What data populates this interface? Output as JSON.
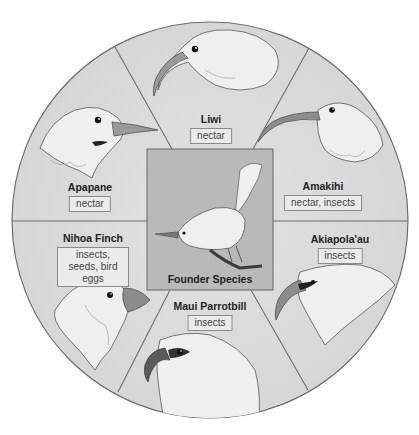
{
  "diagram": {
    "center": {
      "label": "Founder Species"
    },
    "species": [
      {
        "name": "Liwi",
        "diet": "nectar",
        "beak": "long curved"
      },
      {
        "name": "Amakihi",
        "diet": "nectar, insects",
        "beak": "long curved thin"
      },
      {
        "name": "Akiapola'au",
        "diet": "insects",
        "beak": "curved upper, straight lower"
      },
      {
        "name": "Maui Parrotbill",
        "diet": "insects",
        "beak": "hooked parrot-like"
      },
      {
        "name": "Nihoa Finch",
        "diet": "insects, seeds, bird eggs",
        "beak": "short thick conical"
      },
      {
        "name": "Apapane",
        "diet": "nectar",
        "beak": "slightly curved medium"
      }
    ],
    "colors": {
      "circle_fill": "#dcdcdc",
      "center_fill": "#b9b9b9",
      "divider": "#6e6e6e",
      "diet_box_fill": "#ebebeb"
    }
  }
}
